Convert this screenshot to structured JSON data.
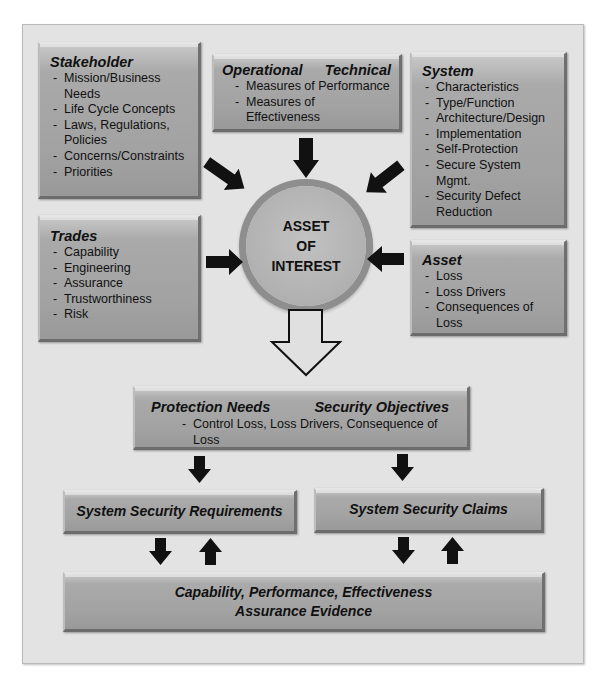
{
  "stakeholder": {
    "title": "Stakeholder",
    "items": [
      "Mission/Business Needs",
      "Life Cycle Concepts",
      "Laws, Regulations, Policies",
      "Concerns/Constraints",
      "Priorities"
    ]
  },
  "operational_technical": {
    "title_left": "Operational",
    "title_right": "Technical",
    "items": [
      "Measures of Performance",
      "Measures of Effectiveness"
    ]
  },
  "system": {
    "title": "System",
    "items": [
      "Characteristics",
      "Type/Function",
      "Architecture/Design",
      "Implementation",
      "Self-Protection",
      "Secure System Mgmt.",
      "Security Defect Reduction"
    ]
  },
  "trades": {
    "title": "Trades",
    "items": [
      "Capability",
      "Engineering",
      "Assurance",
      "Trustworthiness",
      "Risk"
    ]
  },
  "asset": {
    "title": "Asset",
    "items": [
      "Loss",
      "Loss Drivers",
      "Consequences of Loss"
    ]
  },
  "center": {
    "lines": [
      "ASSET",
      "OF",
      "INTEREST"
    ]
  },
  "protection": {
    "title_left": "Protection Needs",
    "title_right": "Security Objectives",
    "items": [
      "Control Loss, Loss Drivers, Consequence of Loss"
    ]
  },
  "requirements": {
    "label": "System Security Requirements"
  },
  "claims": {
    "label": "System Security Claims"
  },
  "evidence": {
    "lines": [
      "Capability, Performance, Effectiveness",
      "Assurance Evidence"
    ]
  },
  "colors": {
    "frame_bg": "#e3e3e3",
    "box_fill": "#a6a6a6",
    "circle_ring": "#8e8e8e",
    "arrow": "#111111"
  }
}
